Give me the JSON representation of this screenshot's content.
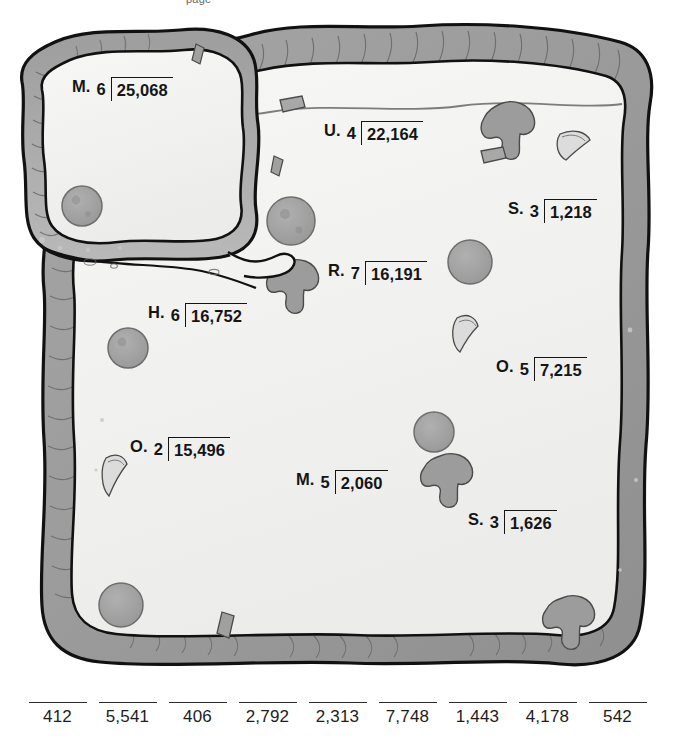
{
  "worksheet": {
    "header_fragment": "page",
    "theme_colors": {
      "crust_dark": "#9a9a9a",
      "crust_mid": "#b4b4b4",
      "bread_fill": "#f2f2f0",
      "topping_gray": "#9c9c9c",
      "outline": "#111111",
      "text": "#151515"
    }
  },
  "problems": [
    {
      "id": "problem-m-25068",
      "label": "M.",
      "divisor": "6",
      "dividend": "25,068",
      "x": 72,
      "y": 77
    },
    {
      "id": "problem-u-22164",
      "label": "U.",
      "divisor": "4",
      "dividend": "22,164",
      "x": 324,
      "y": 121
    },
    {
      "id": "problem-s-1218",
      "label": "S.",
      "divisor": "3",
      "dividend": "1,218",
      "x": 508,
      "y": 199
    },
    {
      "id": "problem-r-16191",
      "label": "R.",
      "divisor": "7",
      "dividend": "16,191",
      "x": 328,
      "y": 261
    },
    {
      "id": "problem-h-16752",
      "label": "H.",
      "divisor": "6",
      "dividend": "16,752",
      "x": 148,
      "y": 303
    },
    {
      "id": "problem-o-7215",
      "label": "O.",
      "divisor": "5",
      "dividend": "7,215",
      "x": 496,
      "y": 357
    },
    {
      "id": "problem-o-15496",
      "label": "O.",
      "divisor": "2",
      "dividend": "15,496",
      "x": 130,
      "y": 437
    },
    {
      "id": "problem-m-2060",
      "label": "M.",
      "divisor": "5",
      "dividend": "2,060",
      "x": 296,
      "y": 470
    },
    {
      "id": "problem-s-1626",
      "label": "S.",
      "divisor": "3",
      "dividend": "1,626",
      "x": 468,
      "y": 510
    }
  ],
  "answer_bank": {
    "answers": [
      "412",
      "5,541",
      "406",
      "2,792",
      "2,313",
      "7,748",
      "1,443",
      "4,178",
      "542"
    ]
  }
}
